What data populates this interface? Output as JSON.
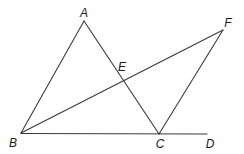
{
  "figure": {
    "type": "geometry-diagram",
    "points": {
      "A": {
        "label": "A",
        "x": 84,
        "y": 21,
        "label_x": 84,
        "label_y": 13
      },
      "B": {
        "label": "B",
        "x": 21,
        "y": 133,
        "label_x": 13,
        "label_y": 143
      },
      "C": {
        "label": "C",
        "x": 159,
        "y": 134,
        "label_x": 160,
        "label_y": 144
      },
      "D": {
        "label": "D",
        "x": 207,
        "y": 134,
        "label_x": 210,
        "label_y": 144
      },
      "E": {
        "label": "E",
        "x": 122,
        "y": 77,
        "label_x": 122,
        "label_y": 67
      },
      "F": {
        "label": "F",
        "x": 223,
        "y": 30,
        "label_x": 228,
        "label_y": 23
      }
    },
    "segments": [
      {
        "name": "AB",
        "from": "A",
        "to": "B"
      },
      {
        "name": "AC",
        "from": "A",
        "to": "C"
      },
      {
        "name": "BF",
        "from": "B",
        "to": "F"
      },
      {
        "name": "CF",
        "from": "C",
        "to": "F"
      },
      {
        "name": "BD",
        "from": "B",
        "to": "D"
      }
    ],
    "colors": {
      "line": "#3a3a3a",
      "label": "#1a1a1a",
      "background": "#ffffff"
    }
  }
}
